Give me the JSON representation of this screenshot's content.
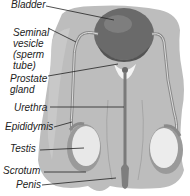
{
  "diagram": {
    "colors": {
      "background": "#ffffff",
      "body_tissue": "#b4b4b4",
      "body_tissue_light": "#c6c6c6",
      "bladder": "#6e6e6e",
      "bladder_dark": "#5a5a5a",
      "testis": "#e8e8e8",
      "testis_shadow": "#9a9a9a",
      "duct": "#7c7c7c",
      "leader_line": "#222222",
      "text": "#222222"
    },
    "labels": [
      {
        "id": "bladder",
        "text": "Bladder"
      },
      {
        "id": "seminal-vesicle",
        "lines": [
          "Seminal",
          "vesicle",
          "(sperm",
          "tube)"
        ]
      },
      {
        "id": "prostate-gland",
        "lines": [
          "Prostate",
          "gland"
        ]
      },
      {
        "id": "urethra",
        "text": "Urethra"
      },
      {
        "id": "epididymis",
        "text": "Epididymis"
      },
      {
        "id": "testis",
        "text": "Testis"
      },
      {
        "id": "scrotum",
        "text": "Scrotum"
      },
      {
        "id": "penis",
        "text": "Penis"
      }
    ]
  }
}
